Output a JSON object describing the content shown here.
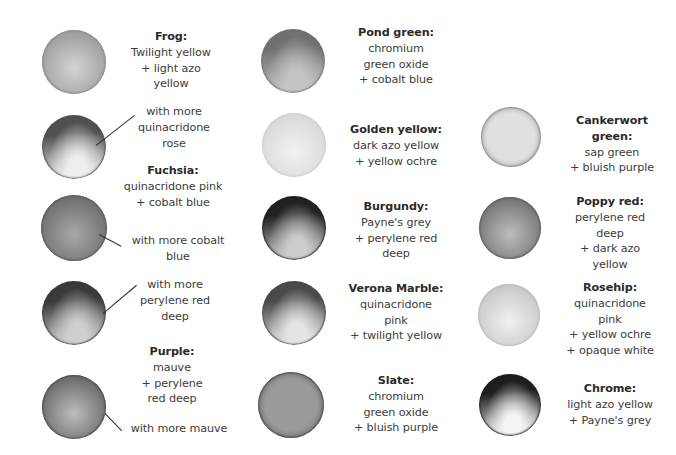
{
  "palette": {
    "columns": [
      {
        "entries": [
          {
            "id": "frog",
            "title": "Frog:",
            "lines": [
              "Twilight yellow",
              "+ light azo",
              "yellow"
            ],
            "swatch": {
              "cx": 74,
              "cy": 62,
              "r": 32,
              "light": "#d4d4d4",
              "dark": "#8a8a8a",
              "style": "even"
            }
          },
          {
            "id": "frog-rose",
            "title": "",
            "lines": [
              "with more",
              "quinacridone",
              "rose"
            ],
            "swatch": {
              "cx": 74,
              "cy": 147,
              "r": 32,
              "light": "#eeeeee",
              "dark": "#505050",
              "style": "topdark"
            }
          },
          {
            "id": "fuchsia",
            "title": "Fuchsia:",
            "lines": [
              "quinacridone pink",
              "+ cobalt blue"
            ],
            "swatch": null
          },
          {
            "id": "fuchsia-cobalt",
            "title": "",
            "lines": [
              "with more cobalt",
              "blue"
            ],
            "swatch": {
              "cx": 74,
              "cy": 228,
              "r": 33,
              "light": "#a8a8a8",
              "dark": "#5a5a5a",
              "style": "even"
            }
          },
          {
            "id": "fuchsia-red",
            "title": "",
            "lines": [
              "with more",
              "perylene red",
              "deep"
            ],
            "swatch": {
              "cx": 74,
              "cy": 313,
              "r": 32,
              "light": "#cfcfcf",
              "dark": "#3a3a3a",
              "style": "topdark"
            }
          },
          {
            "id": "purple",
            "title": "Purple:",
            "lines": [
              "mauve",
              "+ perylene",
              "red deep"
            ],
            "swatch": null
          },
          {
            "id": "purple-mauve",
            "title": "",
            "lines": [
              "with more mauve"
            ],
            "swatch": {
              "cx": 74,
              "cy": 407,
              "r": 32,
              "light": "#bdbdbd",
              "dark": "#4c4c4c",
              "style": "even"
            }
          }
        ]
      },
      {
        "entries": [
          {
            "id": "pond-green",
            "title": "Pond green:",
            "lines": [
              "chromium",
              "green oxide",
              "+ cobalt blue"
            ],
            "swatch": {
              "cx": 293,
              "cy": 61,
              "r": 32,
              "light": "#c4c4c4",
              "dark": "#707070",
              "style": "topdark"
            }
          },
          {
            "id": "golden-yellow",
            "title": "Golden yellow:",
            "lines": [
              "dark azo yellow",
              "+ yellow ochre"
            ],
            "swatch": {
              "cx": 294,
              "cy": 145,
              "r": 32,
              "light": "#f2f2f2",
              "dark": "#cfcfcf",
              "style": "even"
            }
          },
          {
            "id": "burgundy",
            "title": "Burgundy:",
            "lines": [
              "Payne's grey",
              "+ perylene red",
              "deep"
            ],
            "swatch": {
              "cx": 294,
              "cy": 228,
              "r": 32,
              "light": "#cccccc",
              "dark": "#222222",
              "style": "topdark"
            }
          },
          {
            "id": "verona-marble",
            "title": "Verona Marble:",
            "lines": [
              "quinacridone",
              "pink",
              "+ twilight yellow"
            ],
            "swatch": {
              "cx": 294,
              "cy": 313,
              "r": 32,
              "light": "#e4e4e4",
              "dark": "#4a4a4a",
              "style": "topdark"
            }
          },
          {
            "id": "slate",
            "title": "Slate:",
            "lines": [
              "chromium",
              "green oxide",
              "+ bluish purple"
            ],
            "swatch": {
              "cx": 291,
              "cy": 405,
              "r": 33,
              "light": "#9a9a9a",
              "dark": "#4a4a4a",
              "style": "edge"
            }
          }
        ]
      },
      {
        "entries": [
          {
            "id": "cankerwort-green",
            "title": "Cankerwort green:",
            "title_lines": [
              "Cankerwort",
              "green:"
            ],
            "lines": [
              "sap green",
              "+ bluish purple"
            ],
            "swatch": {
              "cx": 511,
              "cy": 137,
              "r": 30,
              "light": "#e0e0e0",
              "dark": "#8c8c8c",
              "style": "edge"
            }
          },
          {
            "id": "poppy-red",
            "title": "Poppy red:",
            "lines": [
              "perylene red",
              "deep",
              "+ dark azo",
              "yellow"
            ],
            "swatch": {
              "cx": 510,
              "cy": 228,
              "r": 31,
              "light": "#bdbdbd",
              "dark": "#5c5c5c",
              "style": "even"
            }
          },
          {
            "id": "rosehip",
            "title": "Rosehip:",
            "lines": [
              "quinacridone",
              "pink",
              "+ yellow ochre",
              "+ opaque white"
            ],
            "swatch": {
              "cx": 509,
              "cy": 315,
              "r": 31,
              "light": "#f0f0f0",
              "dark": "#bababa",
              "style": "even"
            }
          },
          {
            "id": "chrome",
            "title": "Chrome:",
            "lines": [
              "light azo yellow",
              "+ Payne's grey"
            ],
            "swatch": {
              "cx": 510,
              "cy": 405,
              "r": 31,
              "light": "#f4f4f4",
              "dark": "#1e1e1e",
              "style": "topdark"
            }
          }
        ]
      }
    ]
  },
  "labels": {
    "frog": {
      "title": "Frog:",
      "l1": "Twilight yellow",
      "l2": "+ light azo",
      "l3": "yellow"
    },
    "frog_rose": {
      "l1": "with more",
      "l2": "quinacridone",
      "l3": "rose"
    },
    "fuchsia": {
      "title": "Fuchsia:",
      "l1": "quinacridone pink",
      "l2": "+ cobalt blue"
    },
    "fuchsia_cobalt": {
      "l1": "with more cobalt",
      "l2": "blue"
    },
    "fuchsia_red": {
      "l1": "with more",
      "l2": "perylene red",
      "l3": "deep"
    },
    "purple": {
      "title": "Purple:",
      "l1": "mauve",
      "l2": "+ perylene",
      "l3": "red deep"
    },
    "purple_mauve": {
      "l1": "with more mauve"
    },
    "pond_green": {
      "title": "Pond green:",
      "l1": "chromium",
      "l2": "green oxide",
      "l3": "+ cobalt blue"
    },
    "golden_yellow": {
      "title": "Golden yellow:",
      "l1": "dark azo yellow",
      "l2": "+ yellow ochre"
    },
    "burgundy": {
      "title": "Burgundy:",
      "l1": "Payne's grey",
      "l2": "+ perylene red",
      "l3": "deep"
    },
    "verona_marble": {
      "title": "Verona Marble:",
      "l1": "quinacridone",
      "l2": "pink",
      "l3": "+ twilight yellow"
    },
    "slate": {
      "title": "Slate:",
      "l1": "chromium",
      "l2": "green oxide",
      "l3": "+ bluish purple"
    },
    "cankerwort": {
      "t1": "Cankerwort",
      "t2": "green:",
      "l1": "sap green",
      "l2": "+ bluish purple"
    },
    "poppy_red": {
      "title": "Poppy red:",
      "l1": "perylene red",
      "l2": "deep",
      "l3": "+ dark azo",
      "l4": "yellow"
    },
    "rosehip": {
      "title": "Rosehip:",
      "l1": "quinacridone",
      "l2": "pink",
      "l3": "+ yellow ochre",
      "l4": "+ opaque white"
    },
    "chrome": {
      "title": "Chrome:",
      "l1": "light azo yellow",
      "l2": "+ Payne's grey"
    }
  }
}
